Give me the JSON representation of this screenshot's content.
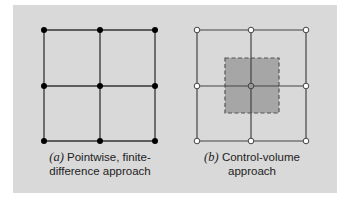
{
  "figure": {
    "background_color": "#d9d9d9",
    "panel_a": {
      "label": "(a)",
      "caption_line1": "Pointwise, finite-",
      "caption_line2": "difference approach",
      "node_style": "filled",
      "node_color": "#000000",
      "grid": {
        "rows": 3,
        "cols": 3
      }
    },
    "panel_b": {
      "label": "(b)",
      "caption_line1": "Control-volume",
      "caption_line2": "approach",
      "node_style": "open",
      "node_fill": "#ffffff",
      "center_node_fill": "#999999",
      "control_volume_fill": "#a6a6a6",
      "control_volume_border": "dashed",
      "grid": {
        "rows": 3,
        "cols": 3
      }
    }
  }
}
